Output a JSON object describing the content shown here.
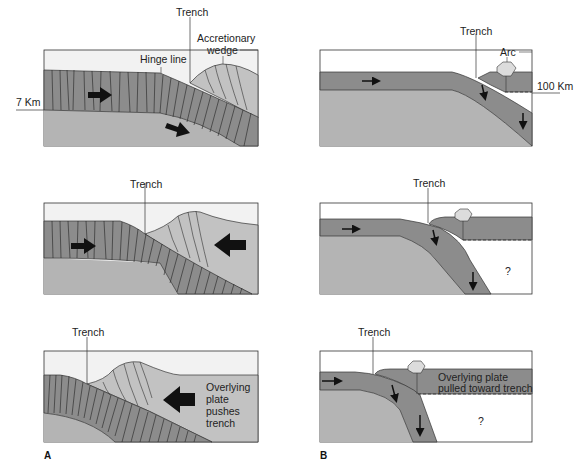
{
  "figure": {
    "panels": {
      "A": {
        "label": "A",
        "rows": [
          {
            "labels": {
              "trench": "Trench",
              "hinge": "Hinge line",
              "wedge_1": "Accretionary",
              "wedge_2": "wedge",
              "depth": "7 Km"
            }
          },
          {
            "labels": {
              "trench": "Trench"
            }
          },
          {
            "labels": {
              "trench": "Trench",
              "note_1": "Overlying",
              "note_2": "plate",
              "note_3": "pushes",
              "note_4": "trench"
            }
          }
        ]
      },
      "B": {
        "label": "B",
        "rows": [
          {
            "labels": {
              "trench": "Trench",
              "arc": "Arc",
              "depth": "100 Km"
            }
          },
          {
            "labels": {
              "trench": "Trench",
              "unknown": "?"
            }
          },
          {
            "labels": {
              "trench": "Trench",
              "note_1": "Overlying plate",
              "note_2": "pulled toward trench",
              "unknown": "?"
            }
          }
        ]
      }
    },
    "colors": {
      "sky": "#f2f2f2",
      "mantle": "#b4b4b4",
      "slab": "#8c8c8c",
      "wedge": "#c2c2c2",
      "arc": "#dcdcdc",
      "line": "#333333",
      "arrow": "#111111"
    }
  }
}
